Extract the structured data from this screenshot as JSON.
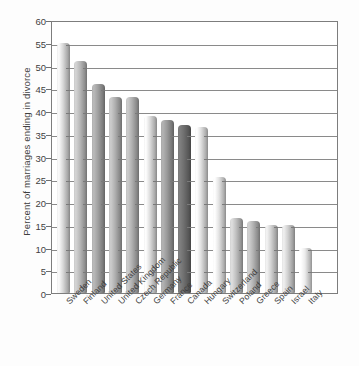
{
  "chart_data": {
    "type": "bar",
    "title": "",
    "xlabel": "",
    "ylabel": "Percent of marriages ending in divorce",
    "ylim": [
      0,
      60
    ],
    "ytick_step": 5,
    "yticks": [
      0,
      5,
      10,
      15,
      20,
      25,
      30,
      35,
      40,
      45,
      50,
      55,
      60
    ],
    "grid": true,
    "legend": "none",
    "categories": [
      "Sweden",
      "Finland",
      "United States",
      "United Kingdom",
      "Czech Republic",
      "Germany",
      "France",
      "Canada",
      "Hungary",
      "Switzerland",
      "Poland",
      "Greece",
      "Spain",
      "Israel",
      "Italy"
    ],
    "values": [
      55,
      51,
      46,
      43,
      43,
      39,
      38,
      37,
      36.5,
      25.5,
      16.5,
      15.8,
      15,
      15,
      10
    ],
    "bar_shades": [
      "#d8d8d8",
      "#b8b8b8",
      "#a0a0a0",
      "#b0b0b0",
      "#b0b0b0",
      "#dcdcdc",
      "#9a9a9a",
      "#6e6e6e",
      "#e0e0e0",
      "#e2e2e2",
      "#c0c0c0",
      "#b4b4b4",
      "#d2d2d2",
      "#cfcfcf",
      "#ececec"
    ]
  },
  "colors": {
    "axis": "#7d7d7d",
    "grid": "#8a8a8a",
    "text": "#3f3f3f",
    "background": "#ffffff"
  }
}
